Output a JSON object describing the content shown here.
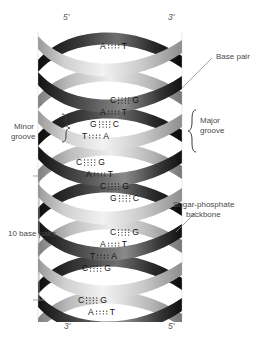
{
  "figure": {
    "background": "#ffffff"
  },
  "strand_ends": {
    "top_left": "5'",
    "top_right": "3'",
    "bottom_left": "3'",
    "bottom_right": "5'"
  },
  "annotations": {
    "base_pair": "Base pair",
    "major_groove_line1": "Major",
    "major_groove_line2": "groove",
    "minor_groove_line1": "Minor",
    "minor_groove_line2": "groove",
    "backbone_line1": "Sugar-phosphate",
    "backbone_line2": "backbone",
    "ten_base_pairs": "10 base pairs"
  },
  "colors": {
    "ribbon_dark": "#171717",
    "ribbon_light": "#d8d8d8",
    "ribbon_mid": "#7d7d7d",
    "text": "#4a4a4a",
    "base_text": "#141414",
    "leader_line": "#8d8d8d"
  },
  "chart_data": {
    "type": "diagram",
    "base_pairs": [
      {
        "index": 1,
        "left": "A",
        "right": "T",
        "bonds": 2,
        "y": 46,
        "x": 118
      },
      {
        "index": 2,
        "left": "C",
        "right": "G",
        "bonds": 3,
        "y": 100,
        "x": 128
      },
      {
        "index": 3,
        "left": "A",
        "right": "T",
        "bonds": 2,
        "y": 112,
        "x": 118
      },
      {
        "index": 4,
        "left": "G",
        "right": "C",
        "bonds": 3,
        "y": 124,
        "x": 108
      },
      {
        "index": 5,
        "left": "T",
        "right": "A",
        "bonds": 2,
        "y": 136,
        "x": 100
      },
      {
        "index": 6,
        "left": "C",
        "right": "G",
        "bonds": 3,
        "y": 162,
        "x": 94
      },
      {
        "index": 7,
        "left": "A",
        "right": "T",
        "bonds": 2,
        "y": 174,
        "x": 104
      },
      {
        "index": 8,
        "left": "C",
        "right": "G",
        "bonds": 3,
        "y": 186,
        "x": 118
      },
      {
        "index": 9,
        "left": "G",
        "right": "C",
        "bonds": 3,
        "y": 198,
        "x": 128
      },
      {
        "index": 10,
        "left": "C",
        "right": "G",
        "bonds": 3,
        "y": 232,
        "x": 128
      },
      {
        "index": 11,
        "left": "A",
        "right": "T",
        "bonds": 2,
        "y": 244,
        "x": 118
      },
      {
        "index": 12,
        "left": "T",
        "right": "A",
        "bonds": 2,
        "y": 256,
        "x": 108
      },
      {
        "index": 13,
        "left": "C",
        "right": "G",
        "bonds": 3,
        "y": 268,
        "x": 100
      },
      {
        "index": 14,
        "left": "C",
        "right": "G",
        "bonds": 3,
        "y": 300,
        "x": 96
      },
      {
        "index": 15,
        "left": "A",
        "right": "T",
        "bonds": 2,
        "y": 312,
        "x": 106
      }
    ],
    "notes": {
      "at_bonds": 2,
      "gc_bonds": 3,
      "turn_repeat": "10 base pairs per helical turn"
    }
  }
}
